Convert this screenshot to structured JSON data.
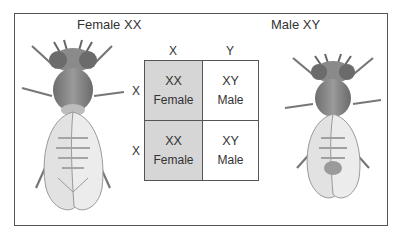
{
  "diagram": {
    "type": "punnett-square",
    "female": {
      "label": "Female XX",
      "icon": "fruit-fly-female-icon"
    },
    "male": {
      "label": "Male XY",
      "icon": "fruit-fly-male-icon"
    },
    "columns": [
      "X",
      "Y"
    ],
    "rows": [
      "X",
      "X"
    ],
    "cells": [
      [
        {
          "genotype": "XX",
          "sex": "Female",
          "shaded": true
        },
        {
          "genotype": "XY",
          "sex": "Male",
          "shaded": false
        }
      ],
      [
        {
          "genotype": "XX",
          "sex": "Female",
          "shaded": true
        },
        {
          "genotype": "XY",
          "sex": "Male",
          "shaded": false
        }
      ]
    ],
    "colors": {
      "female_cell": "#d6d6d6",
      "male_cell": "#ffffff",
      "border": "#555555"
    }
  }
}
